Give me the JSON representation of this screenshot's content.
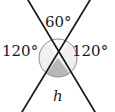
{
  "figure": {
    "type": "geometry-diagram",
    "labels": {
      "top_angle": "60°",
      "left_angle": "120°",
      "right_angle": "120°",
      "height": "h"
    },
    "colors": {
      "line": "#1a1a1a",
      "circle_stroke": "#8c8c8c",
      "sector_light": "#f0f0f0",
      "sector_shaded": "#b8b8b8",
      "background": "#ffffff",
      "text": "#1a1a1a"
    },
    "geometry": {
      "intersection_x": 58,
      "intersection_y": 58,
      "circle_radius": 19,
      "line_a_start": "28,0",
      "line_a_end": "95,112",
      "line_b_start": "90,0",
      "line_b_end": "22,112",
      "top_sector_angle_deg": 60,
      "bottom_sector_angle_deg": 60,
      "side_sector_angle_deg": 120
    }
  }
}
